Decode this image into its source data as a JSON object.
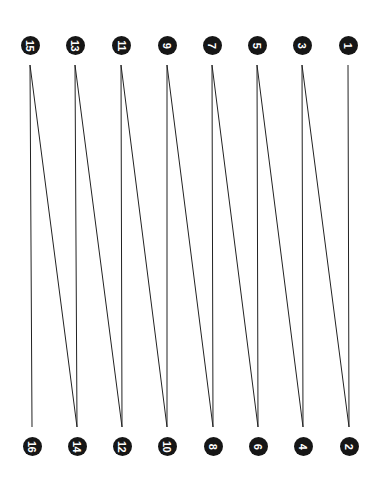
{
  "diagram": {
    "line_color": "#222222",
    "node_color": "#161616",
    "node_text_color": "#ffffff",
    "line_top_y": 65,
    "line_bottom_y": 427,
    "nodes": [
      {
        "label": "1",
        "x": 348,
        "y": 45
      },
      {
        "label": "2",
        "x": 349,
        "y": 446
      },
      {
        "label": "3",
        "x": 302,
        "y": 45
      },
      {
        "label": "4",
        "x": 303,
        "y": 446
      },
      {
        "label": "5",
        "x": 257,
        "y": 45
      },
      {
        "label": "6",
        "x": 258,
        "y": 446
      },
      {
        "label": "7",
        "x": 212,
        "y": 45
      },
      {
        "label": "8",
        "x": 213,
        "y": 446
      },
      {
        "label": "9",
        "x": 167,
        "y": 45
      },
      {
        "label": "10",
        "x": 167,
        "y": 446
      },
      {
        "label": "11",
        "x": 121,
        "y": 45
      },
      {
        "label": "12",
        "x": 122,
        "y": 446
      },
      {
        "label": "13",
        "x": 75,
        "y": 45
      },
      {
        "label": "14",
        "x": 77,
        "y": 446
      },
      {
        "label": "15",
        "x": 30,
        "y": 45
      },
      {
        "label": "16",
        "x": 32,
        "y": 446
      }
    ]
  }
}
